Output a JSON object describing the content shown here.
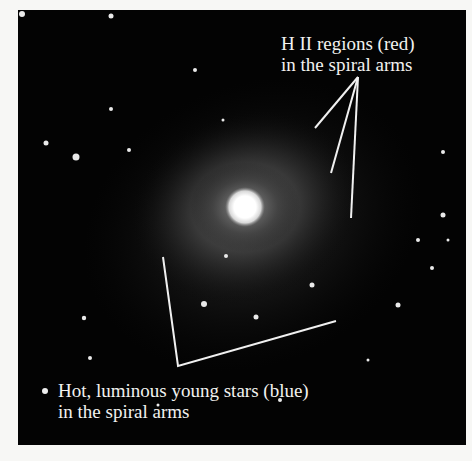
{
  "figure": {
    "annotations": {
      "top": {
        "line1": "H II regions (red)",
        "line2": "in the spiral arms"
      },
      "bottom": {
        "line1": "Hot, luminous young stars (blue)",
        "line2": "in the spiral arms"
      }
    },
    "colors": {
      "background": "#f7f7f5",
      "sky": "#030303",
      "annotation": "#f2f2f0"
    }
  }
}
